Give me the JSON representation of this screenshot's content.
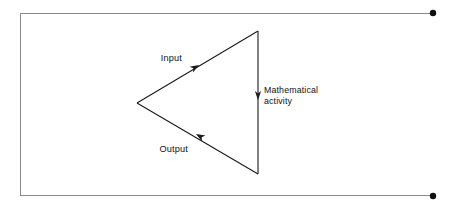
{
  "figure": {
    "type": "cycle-diagram",
    "background_color": "#ffffff",
    "stroke_color": "#1a1a1a",
    "frame_color": "#8a8a8a",
    "frame": {
      "name": "page-border-frame",
      "left": 20,
      "top": 13,
      "right": 433,
      "bottom": 196,
      "note": "open rectangle whose top and bottom rules run right to terminal dots"
    },
    "terminal_dots": [
      {
        "name": "top-right-terminal-dot",
        "cx": 433,
        "cy": 13,
        "r": 3.2
      },
      {
        "name": "bottom-right-terminal-dot",
        "cx": 433,
        "cy": 196,
        "r": 3.2
      }
    ],
    "triangle": {
      "apex_left": {
        "x": 137,
        "y": 103
      },
      "vertex_top_right": {
        "x": 258,
        "y": 31
      },
      "vertex_bottom_right": {
        "x": 258,
        "y": 174
      }
    },
    "edges": [
      {
        "name": "input-edge",
        "label": "Input",
        "from": "apex_left",
        "to": "vertex_top_right",
        "direction": "up-right",
        "arrow_at": {
          "x": 196,
          "y": 67
        },
        "label_pos": {
          "x": 182,
          "y": 58
        },
        "label_anchor": "end"
      },
      {
        "name": "output-edge",
        "label": "Output",
        "from": "vertex_bottom_right",
        "to": "apex_left",
        "direction": "up-left",
        "arrow_at": {
          "x": 199,
          "y": 136
        },
        "label_pos": {
          "x": 186,
          "y": 150
        },
        "label_anchor": "end"
      },
      {
        "name": "mathematical-activity-edge",
        "label_line_1": "Mathematical",
        "label_line_2": "activity",
        "from": "vertex_top_right",
        "to": "vertex_bottom_right",
        "direction": "down",
        "arrow_at": {
          "x": 258,
          "y": 97
        },
        "label_pos": {
          "x": 264,
          "y": 90
        },
        "label_anchor": "start"
      }
    ]
  },
  "labels": {
    "input": "Input",
    "output": "Output",
    "math_activity_line1": "Mathematical",
    "math_activity_line2": "activity"
  }
}
